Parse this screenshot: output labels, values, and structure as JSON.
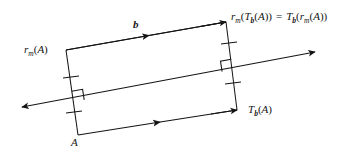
{
  "figure": {
    "type": "geometry-diagram",
    "background_color": "#ffffff",
    "stroke_color": "#141414"
  },
  "labels": {
    "top_right_equation": {
      "name": "image-point-equation",
      "reflect_fn": "r",
      "reflect_sub": "m",
      "open1": "(",
      "translate_fn": "T",
      "translate_sub": "b",
      "open2": "(",
      "point": "A",
      "close2": ")",
      "close1": ")",
      "equals": "=",
      "rhs_translate_fn": "T",
      "rhs_translate_sub": "b",
      "rhs_open1": "(",
      "rhs_reflect_fn": "r",
      "rhs_reflect_sub": "m",
      "rhs_open2": "(",
      "rhs_point": "A",
      "rhs_close2": ")",
      "rhs_close1": ")",
      "plain": "r_m(T_b(A)) = T_b(r_m(A))"
    },
    "top_left_point": {
      "name": "reflected-point",
      "fn": "r",
      "sub": "m",
      "open": "(",
      "point": "A",
      "close": ")",
      "plain": "r_m(A)"
    },
    "bottom_right_point": {
      "name": "translated-point",
      "fn": "T",
      "sub": "b",
      "open": "(",
      "point": "A",
      "close": ")",
      "plain": "T_b(A)"
    },
    "bottom_left_point": {
      "name": "origin-point",
      "text": "A"
    },
    "translation_vector": {
      "name": "translation-vector",
      "text": "b"
    }
  },
  "geometry": {
    "parallelogram": {
      "top_left": [
        66,
        50
      ],
      "top_right": [
        226,
        22
      ],
      "bottom_right": [
        237,
        110
      ],
      "bottom_left": [
        78,
        135
      ]
    },
    "mirror_line": {
      "start": [
        22,
        107
      ],
      "end": [
        315,
        52
      ],
      "arrowheads": "both"
    },
    "tick_marks_per_side": 2,
    "right_angle_markers": 2,
    "edge_arrow_direction": "left-to-right"
  }
}
